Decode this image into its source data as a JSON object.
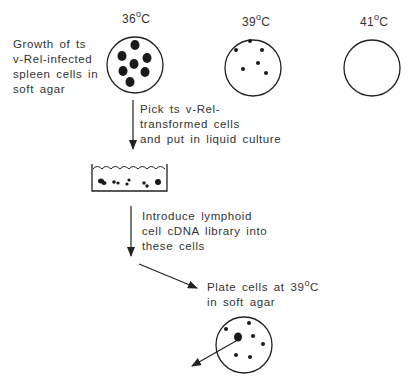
{
  "temperatures": [
    {
      "value": "36",
      "unit_sup": "o",
      "unit": "C"
    },
    {
      "value": "39",
      "unit_sup": "o",
      "unit": "C"
    },
    {
      "value": "41",
      "unit_sup": "o",
      "unit": "C"
    }
  ],
  "labels": {
    "growth": [
      "Growth of ts",
      "v-Rel-infected",
      "spleen cells in",
      "soft agar"
    ],
    "pick": [
      "Pick ts v-Rel-",
      "transformed cells",
      "and put in liquid culture"
    ],
    "introduce": [
      "Introduce lymphoid",
      "cell cDNA library into",
      "these cells"
    ],
    "plate": [
      "Plate cells at 39",
      "o",
      "C",
      "in soft agar"
    ]
  },
  "colors": {
    "ink": "#222222",
    "background": "#ffffff"
  }
}
